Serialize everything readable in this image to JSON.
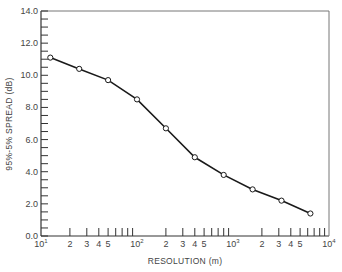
{
  "chart_data": {
    "type": "line",
    "title": "",
    "xlabel": "RESOLUTION (m)",
    "ylabel": "95%-5% SPREAD (dB)",
    "xscale": "log",
    "xlim": [
      10,
      10000
    ],
    "ylim": [
      0,
      14
    ],
    "grid": false,
    "legend": null,
    "x_tick_labels": [
      {
        "value": 10,
        "label": "10",
        "sup": "1"
      },
      {
        "value": 20,
        "label": "2"
      },
      {
        "value": 30,
        "label": "3"
      },
      {
        "value": 40,
        "label": "4"
      },
      {
        "value": 50,
        "label": "5"
      },
      {
        "value": 100,
        "label": "10",
        "sup": "2"
      },
      {
        "value": 200,
        "label": "2"
      },
      {
        "value": 300,
        "label": "3"
      },
      {
        "value": 400,
        "label": "4"
      },
      {
        "value": 500,
        "label": "5"
      },
      {
        "value": 1000,
        "label": "10",
        "sup": "3"
      },
      {
        "value": 2000,
        "label": "2"
      },
      {
        "value": 3000,
        "label": "3"
      },
      {
        "value": 4000,
        "label": "4"
      },
      {
        "value": 5000,
        "label": "5"
      },
      {
        "value": 10000,
        "label": "10",
        "sup": "4"
      }
    ],
    "y_tick_labels": [
      "0.0",
      "2.0",
      "4.0",
      "6.0",
      "8.0",
      "10.0",
      "12.0",
      "14.0"
    ],
    "series": [
      {
        "name": "spread",
        "marker": "open-circle",
        "x": [
          12.5,
          25,
          50,
          100,
          200,
          400,
          800,
          1600,
          3200,
          6400
        ],
        "y": [
          11.1,
          10.4,
          9.7,
          8.5,
          6.7,
          4.9,
          3.8,
          2.9,
          2.2,
          1.4
        ]
      }
    ]
  }
}
